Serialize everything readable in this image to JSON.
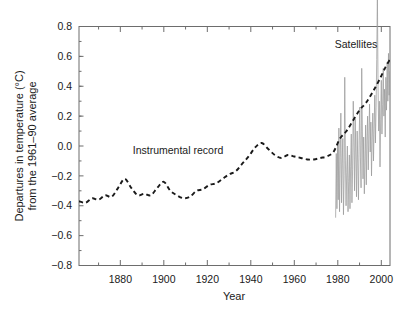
{
  "chart_data": {
    "type": "line",
    "title": "",
    "xlabel": "Year",
    "ylabel": "Departures in temperature (°C) from the 1961–90 average",
    "ylabel_line1": "Departures in temperature (°C)",
    "ylabel_line2": "from the 1961–90 average",
    "xlim": [
      1861,
      2004
    ],
    "ylim": [
      -0.8,
      0.8
    ],
    "xticks": [
      1880,
      1900,
      1920,
      1940,
      1960,
      1980,
      2000
    ],
    "xtick_labels": [
      "1880",
      "1900",
      "1920",
      "1940",
      "1960",
      "1980",
      "2000"
    ],
    "xminor_step": 10,
    "yticks": [
      -0.8,
      -0.6,
      -0.4,
      -0.2,
      0.0,
      0.2,
      0.4,
      0.6,
      0.8
    ],
    "ytick_labels": [
      "−0.8",
      "−0.6",
      "−0.4",
      "−0.2",
      "0.0",
      "0.2",
      "0.4",
      "0.6",
      "0.8"
    ],
    "yminor_step": 0.1,
    "grid": false,
    "legend_position": "none",
    "annotations": [
      {
        "text": "Instrumental record",
        "x": 1910,
        "y": 0.02
      },
      {
        "text": "Satellites",
        "x": 1986,
        "y": 0.62
      }
    ],
    "series": [
      {
        "name": "Instrumental record",
        "style": "dashed",
        "color": "#1a1a1a",
        "x": [
          1861,
          1864,
          1867,
          1870,
          1873,
          1876,
          1879,
          1882,
          1885,
          1888,
          1891,
          1894,
          1897,
          1900,
          1903,
          1906,
          1909,
          1912,
          1915,
          1918,
          1921,
          1924,
          1927,
          1930,
          1933,
          1936,
          1939,
          1942,
          1945,
          1948,
          1951,
          1954,
          1957,
          1960,
          1963,
          1966,
          1969,
          1972,
          1975,
          1978,
          1981,
          1984,
          1987,
          1990,
          1993,
          1996,
          1999,
          2002,
          2004
        ],
        "values": [
          -0.37,
          -0.38,
          -0.35,
          -0.36,
          -0.33,
          -0.34,
          -0.28,
          -0.22,
          -0.28,
          -0.33,
          -0.32,
          -0.33,
          -0.28,
          -0.24,
          -0.3,
          -0.33,
          -0.35,
          -0.34,
          -0.3,
          -0.29,
          -0.26,
          -0.25,
          -0.22,
          -0.19,
          -0.17,
          -0.12,
          -0.07,
          -0.01,
          0.02,
          -0.02,
          -0.06,
          -0.08,
          -0.06,
          -0.07,
          -0.08,
          -0.09,
          -0.09,
          -0.08,
          -0.07,
          -0.04,
          0.05,
          0.1,
          0.17,
          0.24,
          0.29,
          0.36,
          0.44,
          0.53,
          0.58
        ]
      },
      {
        "name": "Satellites",
        "style": "solid-thin",
        "color": "#9b9b9b",
        "x_start": 1979,
        "x_end": 2004,
        "x": [
          1979.0,
          1979.3,
          1979.6,
          1979.9,
          1980.2,
          1980.5,
          1980.8,
          1981.1,
          1981.4,
          1981.7,
          1982.0,
          1982.3,
          1982.6,
          1982.9,
          1983.2,
          1983.5,
          1983.8,
          1984.1,
          1984.4,
          1984.7,
          1985.0,
          1985.3,
          1985.6,
          1985.9,
          1986.2,
          1986.5,
          1986.8,
          1987.1,
          1987.4,
          1987.7,
          1988.0,
          1988.3,
          1988.6,
          1988.9,
          1989.2,
          1989.5,
          1989.8,
          1990.1,
          1990.4,
          1990.7,
          1991.0,
          1991.3,
          1991.6,
          1991.9,
          1992.2,
          1992.5,
          1992.8,
          1993.1,
          1993.4,
          1993.7,
          1994.0,
          1994.3,
          1994.6,
          1994.9,
          1995.2,
          1995.5,
          1995.8,
          1996.1,
          1996.4,
          1996.7,
          1997.0,
          1997.3,
          1997.6,
          1997.9,
          1998.2,
          1998.5,
          1998.8,
          1999.1,
          1999.4,
          1999.7,
          2000.0,
          2000.3,
          2000.6,
          2000.9,
          2001.2,
          2001.5,
          2001.8,
          2002.1,
          2002.4,
          2002.7,
          2003.0,
          2003.3,
          2003.6,
          2003.9
        ],
        "values": [
          -0.48,
          -0.05,
          -0.42,
          0.02,
          -0.36,
          0.12,
          -0.44,
          -0.08,
          0.22,
          -0.38,
          -0.12,
          0.05,
          -0.46,
          -0.2,
          0.46,
          -0.1,
          -0.4,
          -0.18,
          0.0,
          -0.44,
          -0.24,
          -0.06,
          -0.42,
          -0.14,
          0.08,
          -0.38,
          -0.16,
          0.3,
          0.02,
          -0.3,
          0.18,
          -0.06,
          -0.34,
          0.1,
          -0.12,
          -0.36,
          0.04,
          0.26,
          -0.08,
          -0.28,
          0.52,
          0.1,
          -0.22,
          0.06,
          -0.32,
          -0.1,
          0.14,
          -0.26,
          0.04,
          0.2,
          -0.16,
          0.08,
          0.28,
          -0.04,
          0.16,
          -0.2,
          0.06,
          0.22,
          -0.1,
          0.12,
          0.34,
          0.02,
          0.26,
          0.58,
          1.02,
          0.4,
          0.1,
          0.3,
          -0.14,
          0.18,
          0.44,
          0.08,
          0.28,
          0.52,
          0.2,
          0.38,
          0.06,
          0.46,
          0.24,
          0.56,
          0.3,
          0.62,
          0.34,
          0.5
        ]
      }
    ]
  },
  "axis_titles": {
    "x": "Year"
  }
}
